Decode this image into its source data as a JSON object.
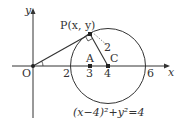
{
  "diagram": {
    "axes": {
      "x_label": "x",
      "y_label": "y",
      "origin_label": "O"
    },
    "ticks": [
      {
        "value": "2",
        "x": 70
      },
      {
        "value": "3",
        "x": 90
      },
      {
        "value": "4",
        "x": 108
      },
      {
        "value": "6",
        "x": 144
      }
    ],
    "points": {
      "P": {
        "label": "P(x, y)"
      },
      "A": {
        "label": "A"
      },
      "C": {
        "label": "C"
      }
    },
    "radius_label": "2",
    "equation": "(x−4)²+y²=4",
    "colors": {
      "stroke": "#333333",
      "background": "#ffffff"
    }
  }
}
